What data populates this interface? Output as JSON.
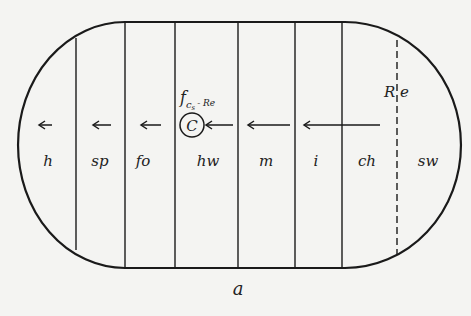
{
  "figure": {
    "caption": "a",
    "zones": [
      {
        "id": "h",
        "label": "h"
      },
      {
        "id": "sp",
        "label": "sp"
      },
      {
        "id": "fo",
        "label": "fo"
      },
      {
        "id": "hw",
        "label": "hw"
      },
      {
        "id": "m",
        "label": "m"
      },
      {
        "id": "i",
        "label": "i"
      },
      {
        "id": "ch",
        "label": "ch"
      },
      {
        "id": "sw",
        "label": "sw"
      }
    ],
    "boundary_label": {
      "left": "R",
      "right": "e"
    },
    "circle_label": "C",
    "annotation": {
      "base": "f",
      "sub": "c",
      "subsub": "s",
      "suffix": "- Re"
    },
    "colors": {
      "line": "#1a1a1a",
      "background": "#f4f4f2"
    }
  }
}
